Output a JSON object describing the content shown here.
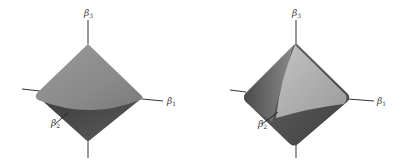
{
  "figure": {
    "panels": [
      {
        "shape": "double-cone",
        "axes": {
          "x": "β",
          "x_sub": "1",
          "y": "β",
          "y_sub": "2",
          "z": "β",
          "z_sub": "3"
        }
      },
      {
        "shape": "rounded-octahedron",
        "axes": {
          "x": "β",
          "x_sub": "1",
          "y": "β",
          "y_sub": "2",
          "z": "β",
          "z_sub": "3"
        }
      }
    ],
    "colors": {
      "upper_surface": "#8a8a8a",
      "lower_surface": "#4a4a4a",
      "highlight": "#bdbdbd",
      "axis": "#333333"
    }
  }
}
